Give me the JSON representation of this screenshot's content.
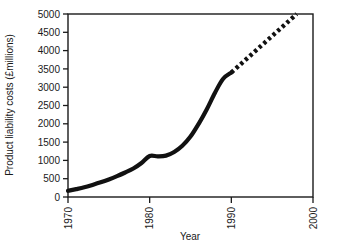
{
  "chart_data": {
    "type": "line",
    "title": "",
    "xlabel": "Year",
    "ylabel": "Product liability costs (£millions)",
    "xlim": [
      1970,
      2000
    ],
    "ylim": [
      0,
      5000
    ],
    "grid": false,
    "legend": "none",
    "xticks": [
      "1970",
      "1980",
      "1990",
      "2000"
    ],
    "xtick_values": [
      1970,
      1980,
      1990,
      2000
    ],
    "yticks": [
      "0",
      "500",
      "1000",
      "1500",
      "2000",
      "2500",
      "3000",
      "3500",
      "4000",
      "4500",
      "5000"
    ],
    "ytick_values": [
      0,
      500,
      1000,
      1500,
      2000,
      2500,
      3000,
      3500,
      4000,
      4500,
      5000
    ],
    "series": [
      {
        "name": "Actual product liability costs",
        "style": "solid",
        "color": "#111111",
        "x": [
          1970,
          1971,
          1972,
          1973,
          1974,
          1975,
          1976,
          1977,
          1978,
          1979,
          1980,
          1981,
          1982,
          1983,
          1984,
          1985,
          1986,
          1987,
          1988,
          1989,
          1990
        ],
        "values": [
          170,
          215,
          265,
          330,
          400,
          480,
          570,
          670,
          780,
          930,
          1120,
          1110,
          1130,
          1230,
          1400,
          1650,
          2000,
          2400,
          2850,
          3230,
          3400
        ]
      },
      {
        "name": "Projected product liability costs",
        "style": "dotted",
        "color": "#111111",
        "x": [
          1990,
          1991,
          1992,
          1993,
          1994,
          1995,
          1996,
          1997,
          1998
        ],
        "values": [
          3400,
          3600,
          3800,
          4000,
          4200,
          4400,
          4600,
          4800,
          5000
        ]
      }
    ],
    "annotations": []
  },
  "axis_labels": {
    "x_title": "Year",
    "y_title": "Product liability costs (£millions)"
  }
}
